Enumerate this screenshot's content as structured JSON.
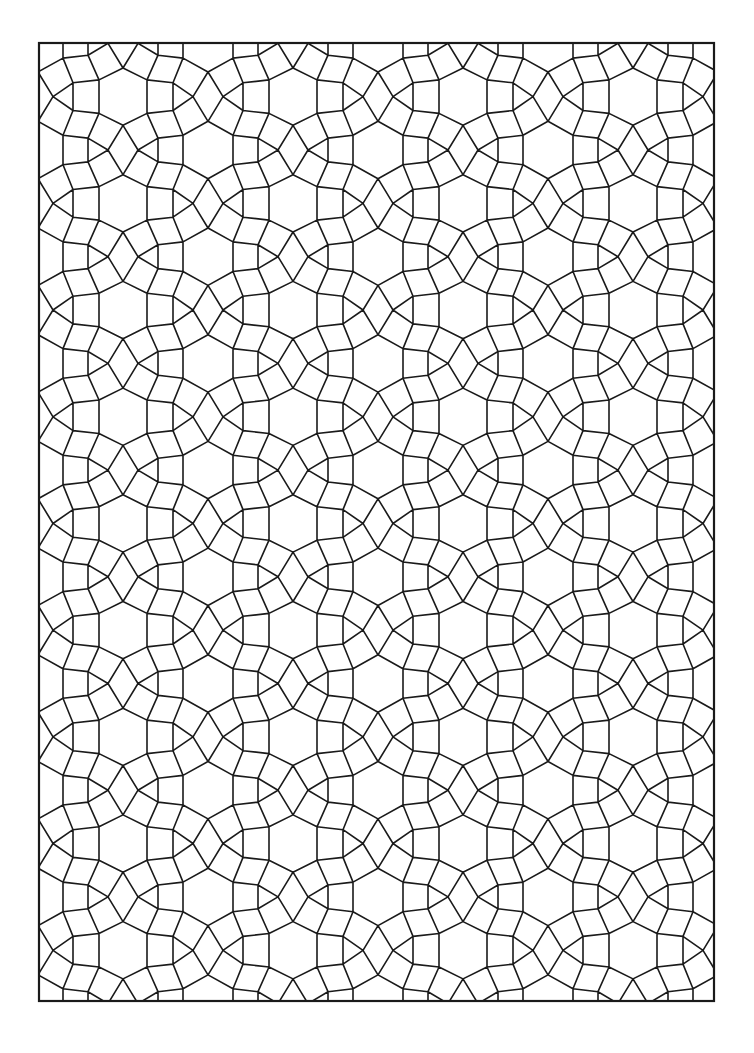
{
  "page": {
    "background_color": "#ffffff",
    "line_color": "#1a1a1a"
  },
  "frame": {
    "x": 39,
    "y": 43,
    "width": 675,
    "height": 958,
    "stroke_width": 2.2
  },
  "pattern": {
    "description": "Repeating tiling of hexagons, diamonds, triangles and quadrilaterals",
    "origin_diamond_center": [
      123,
      150
    ],
    "period_x": 170,
    "period_y": 106.7,
    "motifs": [
      "hexagon",
      "diamond",
      "triangle",
      "quadrilateral"
    ],
    "line_width": 1.6
  }
}
